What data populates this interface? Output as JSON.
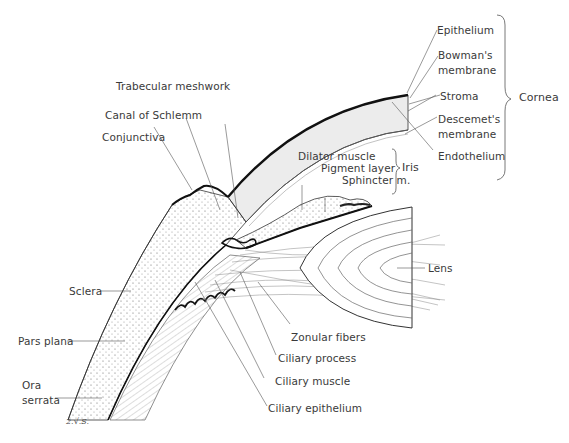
{
  "labels": {
    "epithelium": "Epithelium",
    "bowmans_membrane": "Bowman's\nmembrane",
    "stroma": "Stroma",
    "descemets_membrane": "Descemet's\nmembrane",
    "endothelium": "Endothelium",
    "cornea": "Cornea",
    "trabecular_meshwork": "Trabecular meshwork",
    "canal_of_schlemm": "Canal of Schlemm",
    "conjunctiva": "Conjunctiva",
    "dilator_muscle": "Dilator muscle",
    "pigment_layer": "Pigment layer",
    "sphincter_m": "Sphincter m.",
    "iris": "Iris",
    "lens": "Lens",
    "sclera": "Sclera",
    "pars_plana": "Pars plana",
    "ora_serrata": "Ora\nserrata",
    "zonular_fibers": "Zonular fibers",
    "ciliary_process": "Ciliary process",
    "ciliary_muscle": "Ciliary muscle",
    "ciliary_epithelium": "Ciliary epithelium"
  },
  "groups": {
    "cornea": [
      "Epithelium",
      "Bowman's membrane",
      "Stroma",
      "Descemet's membrane",
      "Endothelium"
    ],
    "iris": [
      "Dilator muscle",
      "Pigment layer",
      "Sphincter m."
    ]
  },
  "signature": "2.√.S.",
  "colors": {
    "ink": "#222222",
    "leader": "#555555",
    "cornea_fill": "#ececec",
    "text": "#3a3a3a"
  }
}
